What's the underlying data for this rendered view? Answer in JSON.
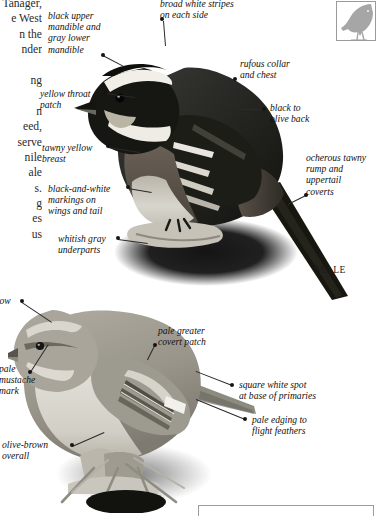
{
  "page": {
    "width": 377,
    "height": 516,
    "background": "#ffffff",
    "kind": "field-guide-plate"
  },
  "body_text": {
    "note": "clipped running text from the facing book column, right-aligned and cut by the page edge",
    "lines": [
      "ed Tanager,",
      "e West",
      "n the",
      "nder",
      "",
      "ng",
      "",
      "n",
      "eed,",
      "serve",
      "nile",
      "ale",
      "s.",
      "g",
      "es",
      "us"
    ]
  },
  "thumbnail": {
    "name": "bird-silhouette-thumbnail",
    "border_color": "#9a9a9a",
    "fill_color": "#a6a6a6"
  },
  "male_caption": {
    "first_letter": "M",
    "rest": "ALE"
  },
  "labels": [
    {
      "id": "black-upper-mandible",
      "text": "black upper\nmandible and\ngray lower\nmandible",
      "x": 48,
      "y": 10,
      "align": "left",
      "dot": {
        "x": 103,
        "y": 55
      },
      "leader": {
        "x1": 103,
        "y1": 55,
        "x2": 124,
        "y2": 66
      }
    },
    {
      "id": "broad-white-stripes",
      "text": "broad white stripes\non each side",
      "x": 160,
      "y": -2,
      "align": "left",
      "dot": {
        "x": 162,
        "y": 19
      },
      "leader": {
        "x1": 164,
        "y1": 21,
        "x2": 166,
        "y2": 46
      }
    },
    {
      "id": "yellow-throat-patch",
      "text": "yellow throat\npatch",
      "x": 40,
      "y": 88,
      "align": "left",
      "dot": {
        "x": 106,
        "y": 92
      },
      "leader": {
        "x1": 106,
        "y1": 93,
        "x2": 135,
        "y2": 97
      }
    },
    {
      "id": "rufous-collar-and-chest",
      "text": "rufous collar\nand chest",
      "x": 240,
      "y": 58,
      "align": "left",
      "dot": {
        "x": 235,
        "y": 79
      },
      "leader": {
        "x1": 235,
        "y1": 80,
        "x2": 215,
        "y2": 88
      }
    },
    {
      "id": "black-to-olive-back",
      "text": "black to\nolive back",
      "x": 270,
      "y": 102,
      "align": "left",
      "dot": {
        "x": 264,
        "y": 109
      },
      "leader": {
        "x1": 264,
        "y1": 110,
        "x2": 240,
        "y2": 110
      }
    },
    {
      "id": "tawny-yellow-breast",
      "text": "tawny yellow\nbreast",
      "x": 42,
      "y": 142,
      "align": "left",
      "dot": {
        "x": 108,
        "y": 146
      },
      "leader": {
        "x1": 108,
        "y1": 147,
        "x2": 140,
        "y2": 152
      }
    },
    {
      "id": "ocherous-tawny-rump",
      "text": "ocherous tawny\nrump and\nuppertail\ncoverts",
      "x": 306,
      "y": 152,
      "align": "left",
      "dot": {
        "x": 306,
        "y": 195
      },
      "leader": {
        "x1": 306,
        "y1": 196,
        "x2": 288,
        "y2": 205
      }
    },
    {
      "id": "black-and-white-markings",
      "text": "black-and-white\nmarkings on\nwings and tail",
      "x": 48,
      "y": 183,
      "align": "left",
      "dot": {
        "x": 128,
        "y": 187
      },
      "leader": {
        "x1": 128,
        "y1": 188,
        "x2": 152,
        "y2": 192
      }
    },
    {
      "id": "whitish-gray-underparts",
      "text": "whitish gray\nunderparts",
      "x": 58,
      "y": 233,
      "align": "left",
      "dot": {
        "x": 118,
        "y": 238
      },
      "leader": {
        "x1": 118,
        "y1": 239,
        "x2": 148,
        "y2": 243
      }
    },
    {
      "id": "clipped-brow-label",
      "text": "row",
      "x": -4,
      "y": 295,
      "align": "left",
      "dot": {
        "x": 22,
        "y": 301
      },
      "leader": {
        "x1": 22,
        "y1": 302,
        "x2": 52,
        "y2": 322
      }
    },
    {
      "id": "pale-greater-covert-patch",
      "text": "pale greater\ncovert patch",
      "x": 158,
      "y": 325,
      "align": "left",
      "dot": {
        "x": 155,
        "y": 345
      },
      "leader": {
        "x1": 155,
        "y1": 346,
        "x2": 148,
        "y2": 360
      }
    },
    {
      "id": "pale-mustache-mark",
      "text": "pale\nmustache\nmark",
      "x": -1,
      "y": 363,
      "align": "left",
      "dot": {
        "x": 30,
        "y": 372
      },
      "leader": {
        "x1": 30,
        "y1": 372,
        "x2": 48,
        "y2": 344
      }
    },
    {
      "id": "square-white-spot",
      "text": "square white spot\nat base of primaries",
      "x": 239,
      "y": 379,
      "align": "left",
      "dot": {
        "x": 232,
        "y": 385
      },
      "leader": {
        "x1": 232,
        "y1": 386,
        "x2": 196,
        "y2": 372
      }
    },
    {
      "id": "pale-edging-flight-feathers",
      "text": "pale edging to\nflight feathers",
      "x": 252,
      "y": 414,
      "align": "left",
      "dot": {
        "x": 245,
        "y": 419
      },
      "leader": {
        "x1": 245,
        "y1": 420,
        "x2": 196,
        "y2": 400
      }
    },
    {
      "id": "olive-brown-overall",
      "text": "olive-brown\noverall",
      "x": 2,
      "y": 439,
      "align": "left",
      "dot": {
        "x": 72,
        "y": 445
      },
      "leader": {
        "x1": 72,
        "y1": 446,
        "x2": 104,
        "y2": 432
      }
    }
  ]
}
